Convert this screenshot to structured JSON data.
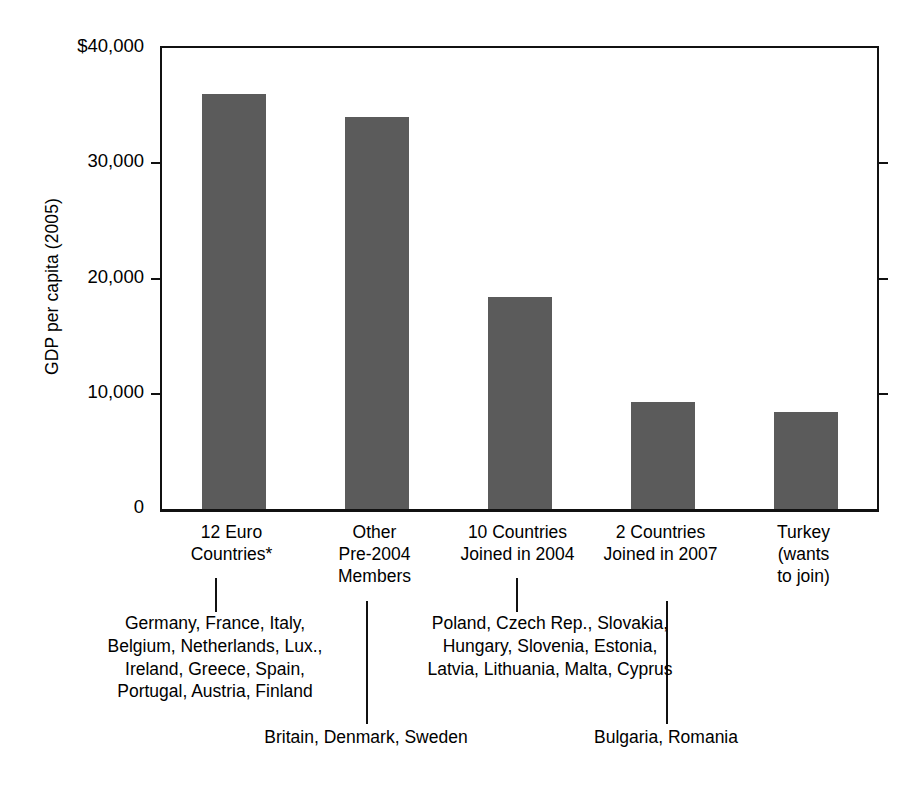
{
  "chart_data": {
    "type": "bar",
    "title": "",
    "subtitle": "",
    "xlabel": "",
    "ylabel": "GDP per capita (2005)",
    "ylim": [
      0,
      40000
    ],
    "grid": false,
    "legend": "none",
    "bar_color": "#5b5b5b",
    "categories": [
      "12 Euro\nCountries*",
      "Other\nPre-2004\nMembers",
      "10 Countries\nJoined in 2004",
      "2 Countries\nJoined in 2007",
      "Turkey\n(wants\nto join)"
    ],
    "values": [
      36000,
      34000,
      18400,
      9300,
      8400
    ],
    "ytick_labels": [
      "$40,000",
      "30,000",
      "20,000",
      "10,000",
      "0"
    ],
    "ytick_values": [
      40000,
      30000,
      20000,
      10000,
      0
    ],
    "annotations": [
      "Germany, France, Italy,\nBelgium, Netherlands, Lux.,\nIreland, Greece, Spain,\nPortugal, Austria, Finland",
      "Britain, Denmark, Sweden",
      "Poland, Czech Rep., Slovakia,\nHungary, Slovenia, Estonia,\nLatvia, Lithuania, Malta, Cyprus",
      "Bulgaria, Romania"
    ]
  },
  "axis": {
    "y_title": "GDP per capita (2005)",
    "ticks": [
      {
        "label": "$40,000",
        "value": 40000
      },
      {
        "label": "30,000",
        "value": 30000
      },
      {
        "label": "20,000",
        "value": 20000
      },
      {
        "label": "10,000",
        "value": 10000
      },
      {
        "label": "0",
        "value": 0
      }
    ]
  },
  "bars": [
    {
      "label": "12 Euro\nCountries*",
      "value": 36000
    },
    {
      "label": "Other\nPre-2004\nMembers",
      "value": 34000
    },
    {
      "label": "10 Countries\nJoined in 2004",
      "value": 18400
    },
    {
      "label": "2 Countries\nJoined in 2007",
      "value": 9300
    },
    {
      "label": "Turkey\n(wants\nto join)",
      "value": 8400
    }
  ],
  "notes": {
    "euro_countries": "Germany, France, Italy,\nBelgium, Netherlands, Lux.,\nIreland, Greece, Spain,\nPortugal, Austria, Finland",
    "other_pre2004": "Britain, Denmark, Sweden",
    "joined_2004": "Poland, Czech Rep., Slovakia,\nHungary, Slovenia, Estonia,\nLatvia, Lithuania, Malta, Cyprus",
    "joined_2007": "Bulgaria, Romania"
  }
}
